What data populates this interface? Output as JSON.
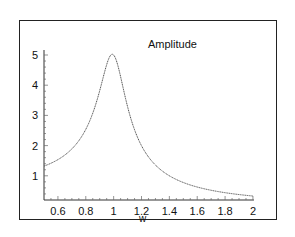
{
  "chart_data": {
    "type": "line",
    "title": "Amplitude",
    "xlabel": "w",
    "ylabel": "",
    "xlim": [
      0.5,
      2
    ],
    "ylim": [
      0.2,
      5.2
    ],
    "grid": false,
    "legend": null,
    "x_ticks": [
      "0.6",
      "0.8",
      "1",
      "1.2",
      "1.4",
      "1.6",
      "1.8",
      "2"
    ],
    "y_ticks": [
      "1",
      "2",
      "3",
      "4",
      "5"
    ],
    "series": [
      {
        "name": "Amplitude",
        "x": [
          0.5,
          0.6,
          0.7,
          0.8,
          0.85,
          0.9,
          0.95,
          1.0,
          1.05,
          1.1,
          1.15,
          1.2,
          1.3,
          1.4,
          1.5,
          1.6,
          1.7,
          1.8,
          1.9,
          2.0
        ],
        "values": [
          1.32,
          1.54,
          1.87,
          2.48,
          2.99,
          3.82,
          4.62,
          5.0,
          4.42,
          3.48,
          2.73,
          2.19,
          1.46,
          1.06,
          0.8,
          0.63,
          0.52,
          0.43,
          0.37,
          0.33
        ]
      }
    ]
  },
  "labels": {
    "title": "Amplitude",
    "xlabel": "w"
  },
  "colors": {
    "curve": "#555555",
    "axis": "#333333",
    "frame": "#222222"
  }
}
